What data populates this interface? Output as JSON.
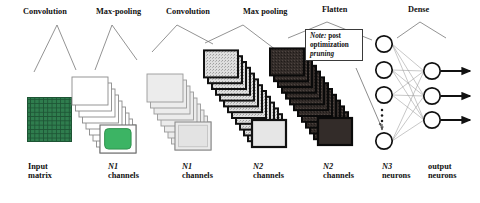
{
  "figure": {
    "type": "cnn-architecture-diagram",
    "background": "#ffffff",
    "ink": "#111111"
  },
  "top_labels": [
    {
      "name": "convolution-1",
      "text": "Convolution"
    },
    {
      "name": "max-pooling-1",
      "text": "Max-pooling"
    },
    {
      "name": "convolution-2",
      "text": "Convolution"
    },
    {
      "name": "max-pooling-2",
      "text": "Max pooling"
    },
    {
      "name": "flatten",
      "text": "Flatten"
    },
    {
      "name": "dense",
      "text": "Dense"
    }
  ],
  "bottom_labels": [
    {
      "name": "input-matrix",
      "line1": "Input",
      "line2": "matrix"
    },
    {
      "name": "n1-channels-a",
      "line1": "N1",
      "line2": "channels"
    },
    {
      "name": "n1-channels-b",
      "line1": "N1",
      "line2": "channels"
    },
    {
      "name": "n2-channels-a",
      "line1": "N2",
      "line2": "channels"
    },
    {
      "name": "n2-channels-b",
      "line1": "N2",
      "line2": "channels"
    },
    {
      "name": "n3-neurons",
      "line1": "N3",
      "line2": "neurons"
    },
    {
      "name": "output-neurons",
      "line1": "output",
      "line2": "neurons"
    }
  ],
  "note": {
    "label": "Note:",
    "text_line1": "post",
    "text_line2": "optimization",
    "text_line3": "pruning",
    "full_text": "Note: post optimization pruning"
  },
  "input_matrix": {
    "grid_rows": 10,
    "grid_cols": 10,
    "fill": "#2f7d4e",
    "gridline": "#1d5434"
  },
  "stacks": [
    {
      "name": "feature-maps-conv1",
      "cards": 9,
      "fill": "#ffffff",
      "stroke": "#8a8a8a",
      "stroke_width": 0.9,
      "inner": {
        "shape": "rounded-rect",
        "fill": "#3cb464",
        "stroke": "#2b8c4a"
      }
    },
    {
      "name": "feature-maps-pool1",
      "cards": 9,
      "fill": "#e8e8e8",
      "stroke": "#9a9a9a",
      "stroke_width": 0.9,
      "inner": {
        "shape": "rect",
        "fill": "#e2e2e2",
        "stroke": "#b4b4b4"
      }
    },
    {
      "name": "feature-maps-conv2",
      "cards": 13,
      "fill": "#d8d8d8",
      "stroke": "#111111",
      "stroke_width": 2.0,
      "inner": {
        "shape": "rect",
        "fill": "#dcdcdc",
        "stroke": "#777777"
      }
    },
    {
      "name": "feature-maps-pool2",
      "cards": 13,
      "fill": "#3a3330",
      "stroke": "#0a0a0a",
      "stroke_width": 2.0,
      "inner": {
        "shape": "rect",
        "fill": "#2e2724",
        "stroke": "#0a0a0a"
      }
    }
  ],
  "network": {
    "dense_layer": {
      "name": "n3-neuron-layer",
      "visible_nodes": 4,
      "ellipsis_dots": 3,
      "node_stroke": "#111111",
      "node_fill": "#ffffff"
    },
    "output_layer": {
      "name": "output-neuron-layer",
      "visible_nodes": 3,
      "node_stroke": "#111111",
      "node_fill": "#ffffff"
    },
    "output_arrows": 3,
    "edge_color": "#8e8e8e"
  }
}
